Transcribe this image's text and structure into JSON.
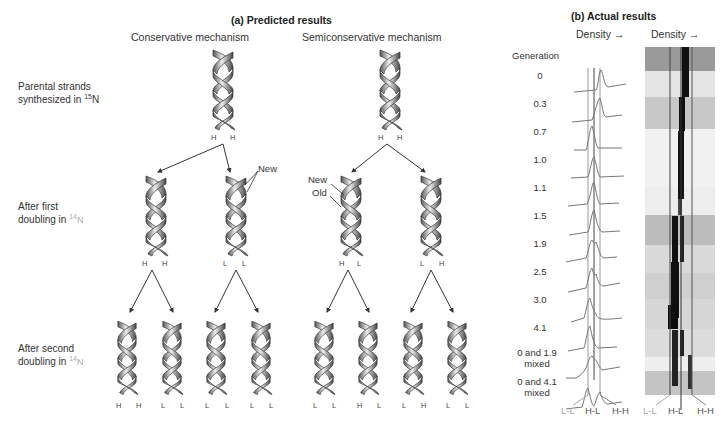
{
  "panel_a": {
    "title": "(a) Predicted results",
    "columns": {
      "conservative": "Conservative mechanism",
      "semiconservative": "Semiconservative mechanism"
    },
    "rows": [
      {
        "label_line1": "Parental strands",
        "label_line2": "synthesized in ",
        "isotope_mass": "15",
        "isotope_el": "N"
      },
      {
        "label_line1": "After first",
        "label_line2": "doubling in ",
        "isotope_mass": "14",
        "isotope_el": "N"
      },
      {
        "label_line1": "After second",
        "label_line2": "doubling in ",
        "isotope_mass": "14",
        "isotope_el": "N"
      }
    ],
    "annotations": {
      "new_conservative": "New",
      "new_semi": "New",
      "old_semi": "Old"
    },
    "conservative": {
      "gen0": [
        [
          "H",
          "H"
        ]
      ],
      "gen1": [
        [
          "H",
          "H"
        ],
        [
          "L",
          "L"
        ]
      ],
      "gen2": [
        [
          "H",
          "H"
        ],
        [
          "L",
          "L"
        ],
        [
          "L",
          "L"
        ],
        [
          "L",
          "L"
        ]
      ]
    },
    "semiconservative": {
      "gen0": [
        [
          "H",
          "H"
        ]
      ],
      "gen1": [
        [
          "H",
          "L"
        ],
        [
          "L",
          "H"
        ]
      ],
      "gen2": [
        [
          "L",
          "L"
        ],
        [
          "H",
          "L"
        ],
        [
          "L",
          "H"
        ],
        [
          "L",
          "L"
        ]
      ]
    }
  },
  "panel_b": {
    "title": "(b) Actual results",
    "density_label_1": "Density →",
    "density_label_2": "Density →",
    "generation_header": "Generation",
    "generations": [
      {
        "label": "0"
      },
      {
        "label": "0.3"
      },
      {
        "label": "0.7"
      },
      {
        "label": "1.0"
      },
      {
        "label": "1.1"
      },
      {
        "label": "1.5"
      },
      {
        "label": "1.9"
      },
      {
        "label": "2.5"
      },
      {
        "label": "3.0"
      },
      {
        "label": "4.1"
      },
      {
        "label": "0 and 1.9",
        "label2": "mixed"
      },
      {
        "label": "0 and 4.1",
        "label2": "mixed"
      }
    ],
    "axis_labels_trace": [
      "L-L",
      "H-L",
      "H-H"
    ],
    "axis_labels_gel": [
      "L-L",
      "H-L",
      "H-H"
    ]
  }
}
